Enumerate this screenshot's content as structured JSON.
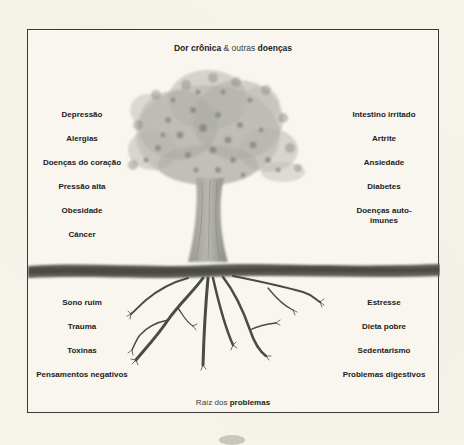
{
  "diagram": {
    "type": "metaphor-tree",
    "title": {
      "part1_bold": "Dor crônica",
      "part2_regular": "& outras",
      "part3_bold": "doenças"
    },
    "footer": {
      "part1_regular": "Raíz dos",
      "part2_bold": "problemas"
    },
    "above_ground": {
      "left": [
        "Depressão",
        "Alergias",
        "Doenças do coração",
        "Pressão alta",
        "Obesidade",
        "Câncer"
      ],
      "right": [
        "Intestino irritado",
        "Artrite",
        "Ansiedade",
        "Diabetes",
        "Doenças auto-imunes"
      ]
    },
    "below_ground": {
      "left": [
        "Sono ruim",
        "Trauma",
        "Toxinas",
        "Pensamentos negativos"
      ],
      "right": [
        "Estresse",
        "Dieta pobre",
        "Sedentarismo",
        "Problemas digestivos"
      ]
    },
    "illustration": {
      "tree": "tree-illustration",
      "ground": "ground-band",
      "roots": "roots-illustration"
    }
  },
  "colors": {
    "background": "#f6f4ea",
    "frame": "#3a3a38",
    "text": "#222220",
    "foliage": "#8c8c88",
    "ground": "#5a5a56"
  }
}
